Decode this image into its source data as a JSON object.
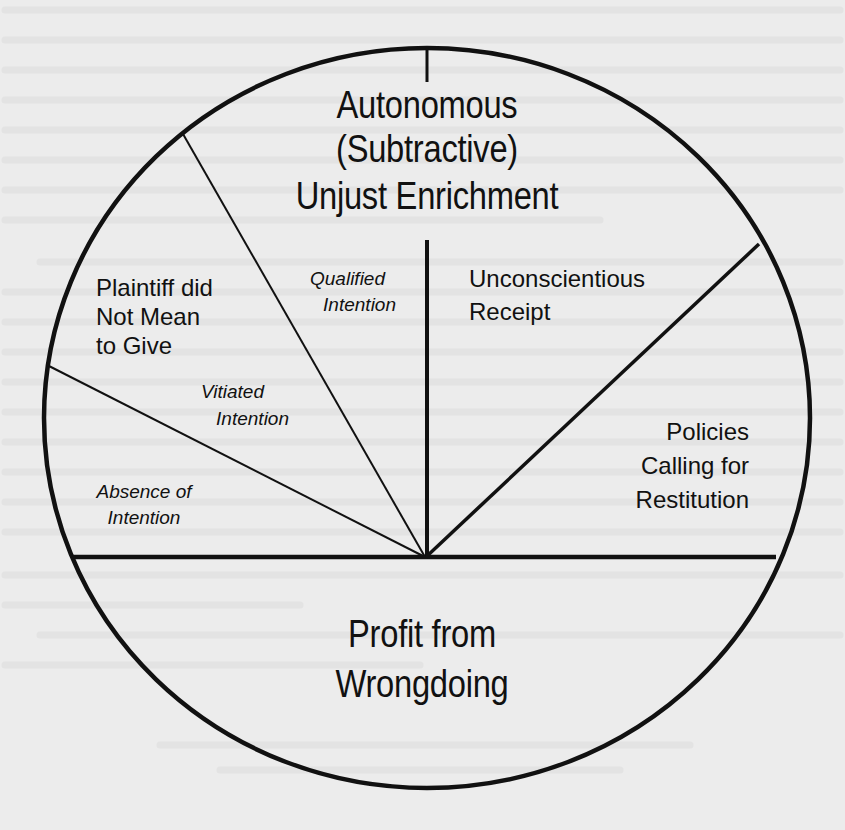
{
  "diagram": {
    "title_lines": [
      "Autonomous",
      "(Subtractive)",
      "Unjust Enrichment"
    ],
    "bottom_lines": [
      "Profit from",
      "Wrongdoing"
    ],
    "segments": {
      "plaintiff": [
        "Plaintiff did",
        "Not Mean",
        "to Give"
      ],
      "qualified": [
        "Qualified",
        "Intention"
      ],
      "vitiated": [
        "Vitiated",
        "Intention"
      ],
      "absence": [
        "Absence of",
        "Intention"
      ],
      "unconscientious": [
        "Unconscientious",
        "Receipt"
      ],
      "policies": [
        "Policies",
        "Calling for",
        "Restitution"
      ]
    },
    "colors": {
      "ink": "#111111",
      "paper": "#ececec"
    }
  }
}
